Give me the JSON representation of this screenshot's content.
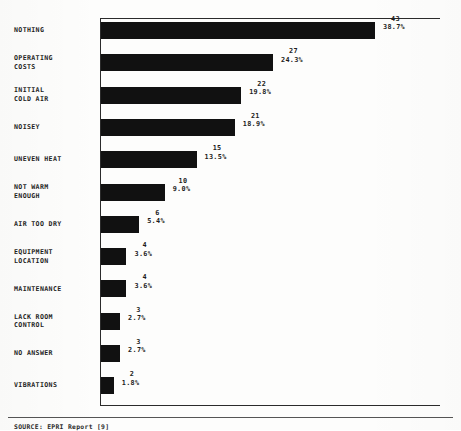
{
  "chart_data": {
    "type": "bar",
    "orientation": "horizontal",
    "title": "",
    "xlabel": "",
    "ylabel": "",
    "grid": false,
    "legend": null,
    "xlim": [
      0,
      43
    ],
    "categories": [
      "NOTHING",
      "OPERATING COSTS",
      "INITIAL COLD AIR",
      "NOISEY",
      "UNEVEN HEAT",
      "NOT WARM ENOUGH",
      "AIR TOO DRY",
      "EQUIPMENT LOCATION",
      "MAINTENANCE",
      "LACK ROOM CONTROL",
      "NO ANSWER",
      "VIBRATIONS"
    ],
    "values": [
      43,
      27,
      22,
      21,
      15,
      10,
      6,
      4,
      4,
      3,
      3,
      2
    ],
    "percent_labels": [
      "38.7%",
      "24.3%",
      "19.8%",
      "18.9%",
      "13.5%",
      "9.0%",
      "5.4%",
      "3.6%",
      "3.6%",
      "2.7%",
      "2.7%",
      "1.8%"
    ],
    "bar_color": "#111111",
    "background_color": "#fdfdfc"
  },
  "rows": [
    {
      "line1": "NOTHING",
      "line2": "",
      "count": "43",
      "pct": "38.7%"
    },
    {
      "line1": "OPERATING",
      "line2": "COSTS",
      "count": "27",
      "pct": "24.3%"
    },
    {
      "line1": "INITIAL",
      "line2": "COLD AIR",
      "count": "22",
      "pct": "19.8%"
    },
    {
      "line1": "NOISEY",
      "line2": "",
      "count": "21",
      "pct": "18.9%"
    },
    {
      "line1": "UNEVEN HEAT",
      "line2": "",
      "count": "15",
      "pct": "13.5%"
    },
    {
      "line1": "NOT WARM",
      "line2": "ENOUGH",
      "count": "10",
      "pct": "9.0%"
    },
    {
      "line1": "AIR TOO DRY",
      "line2": "",
      "count": "6",
      "pct": "5.4%"
    },
    {
      "line1": "EQUIPMENT",
      "line2": "LOCATION",
      "count": "4",
      "pct": "3.6%"
    },
    {
      "line1": "MAINTENANCE",
      "line2": "",
      "count": "4",
      "pct": "3.6%"
    },
    {
      "line1": "LACK ROOM",
      "line2": "CONTROL",
      "count": "3",
      "pct": "2.7%"
    },
    {
      "line1": "NO ANSWER",
      "line2": "",
      "count": "3",
      "pct": "2.7%"
    },
    {
      "line1": "VIBRATIONS",
      "line2": "",
      "count": "2",
      "pct": "1.8%"
    }
  ],
  "footer": {
    "source": "SOURCE: EPRI Report [9]"
  }
}
